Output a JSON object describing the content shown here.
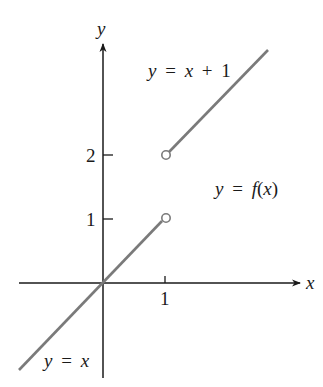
{
  "figure": {
    "axes": {
      "x_label": "x",
      "y_label": "y",
      "x_ticks": [
        {
          "value": 1,
          "label": "1"
        }
      ],
      "y_ticks": [
        {
          "value": 1,
          "label": "1"
        },
        {
          "value": 2,
          "label": "2"
        }
      ]
    },
    "curves": [
      {
        "name": "lower-branch",
        "equation": "y = x",
        "label_y": "y",
        "label_eq": "=",
        "label_rhs": "x",
        "domain": "x < 1",
        "endpoint": {
          "x": 1,
          "y": 1,
          "type": "open"
        }
      },
      {
        "name": "upper-branch",
        "equation": "y = x + 1",
        "label_y": "y",
        "label_eq": "=",
        "label_rhs": "x + 1",
        "domain": "x > 1",
        "endpoint": {
          "x": 1,
          "y": 2,
          "type": "open"
        }
      }
    ],
    "function_label": {
      "y": "y",
      "eq": "=",
      "rhs": "f(x)"
    },
    "colors": {
      "axis": "#1a1a1a",
      "curve": "#7a7a7a",
      "text": "#1a1a1a"
    }
  }
}
